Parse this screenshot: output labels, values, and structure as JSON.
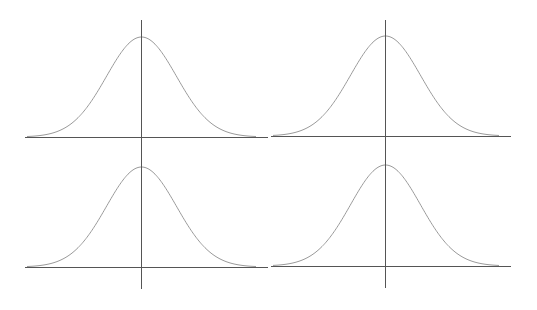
{
  "colors": {
    "background": "#ffffff",
    "axis": "#555555",
    "curve": "#9a9a9a"
  },
  "chart_data": [
    {
      "type": "line",
      "title": "",
      "xlabel": "",
      "ylabel": "",
      "description": "Standard normal (Gaussian) bell curve centered on vertical axis",
      "series": [
        {
          "name": "normal-pdf",
          "mean": 0,
          "std": 1
        }
      ],
      "x": [
        -3.5,
        -3,
        -2.5,
        -2,
        -1.5,
        -1,
        -0.5,
        0,
        0.5,
        1,
        1.5,
        2,
        2.5,
        3,
        3.5
      ],
      "values": [
        0.0009,
        0.0044,
        0.0175,
        0.054,
        0.1295,
        0.242,
        0.3521,
        0.3989,
        0.3521,
        0.242,
        0.1295,
        0.054,
        0.0175,
        0.0044,
        0.0009
      ],
      "grid": false,
      "legend": "none",
      "panel": {
        "x_axis_y": 137,
        "x_axis_x1": 25,
        "x_axis_x2": 268,
        "y_axis_x": 141,
        "y_axis_y1": 20,
        "y_axis_y2": 154,
        "peak_y": 37,
        "sigma_px": 35
      }
    },
    {
      "type": "line",
      "title": "",
      "xlabel": "",
      "ylabel": "",
      "description": "Standard normal (Gaussian) bell curve centered on vertical axis",
      "series": [
        {
          "name": "normal-pdf",
          "mean": 0,
          "std": 1
        }
      ],
      "x": [
        -3.5,
        -3,
        -2.5,
        -2,
        -1.5,
        -1,
        -0.5,
        0,
        0.5,
        1,
        1.5,
        2,
        2.5,
        3,
        3.5
      ],
      "values": [
        0.0009,
        0.0044,
        0.0175,
        0.054,
        0.1295,
        0.242,
        0.3521,
        0.3989,
        0.3521,
        0.242,
        0.1295,
        0.054,
        0.0175,
        0.0044,
        0.0009
      ],
      "grid": false,
      "legend": "none",
      "panel": {
        "x_axis_y": 136,
        "x_axis_x1": 271,
        "x_axis_x2": 511,
        "y_axis_x": 385,
        "y_axis_y1": 20,
        "y_axis_y2": 154,
        "peak_y": 36,
        "sigma_px": 35
      }
    },
    {
      "type": "line",
      "title": "",
      "xlabel": "",
      "ylabel": "",
      "description": "Standard normal (Gaussian) bell curve centered on vertical axis",
      "series": [
        {
          "name": "normal-pdf",
          "mean": 0,
          "std": 1
        }
      ],
      "x": [
        -3.5,
        -3,
        -2.5,
        -2,
        -1.5,
        -1,
        -0.5,
        0,
        0.5,
        1,
        1.5,
        2,
        2.5,
        3,
        3.5
      ],
      "values": [
        0.0009,
        0.0044,
        0.0175,
        0.054,
        0.1295,
        0.242,
        0.3521,
        0.3989,
        0.3521,
        0.242,
        0.1295,
        0.054,
        0.0175,
        0.0044,
        0.0009
      ],
      "grid": false,
      "legend": "none",
      "panel": {
        "x_axis_y": 267,
        "x_axis_x1": 25,
        "x_axis_x2": 268,
        "y_axis_x": 141,
        "y_axis_y1": 150,
        "y_axis_y2": 289,
        "peak_y": 167,
        "sigma_px": 35
      }
    },
    {
      "type": "line",
      "title": "",
      "xlabel": "",
      "ylabel": "",
      "description": "Standard normal (Gaussian) bell curve centered on vertical axis",
      "series": [
        {
          "name": "normal-pdf",
          "mean": 0,
          "std": 1
        }
      ],
      "x": [
        -3.5,
        -3,
        -2.5,
        -2,
        -1.5,
        -1,
        -0.5,
        0,
        0.5,
        1,
        1.5,
        2,
        2.5,
        3,
        3.5
      ],
      "values": [
        0.0009,
        0.0044,
        0.0175,
        0.054,
        0.1295,
        0.242,
        0.3521,
        0.3989,
        0.3521,
        0.242,
        0.1295,
        0.054,
        0.0175,
        0.0044,
        0.0009
      ],
      "grid": false,
      "legend": "none",
      "panel": {
        "x_axis_y": 266,
        "x_axis_x1": 271,
        "x_axis_x2": 511,
        "y_axis_x": 385,
        "y_axis_y1": 150,
        "y_axis_y2": 288,
        "peak_y": 165,
        "sigma_px": 35
      }
    }
  ]
}
